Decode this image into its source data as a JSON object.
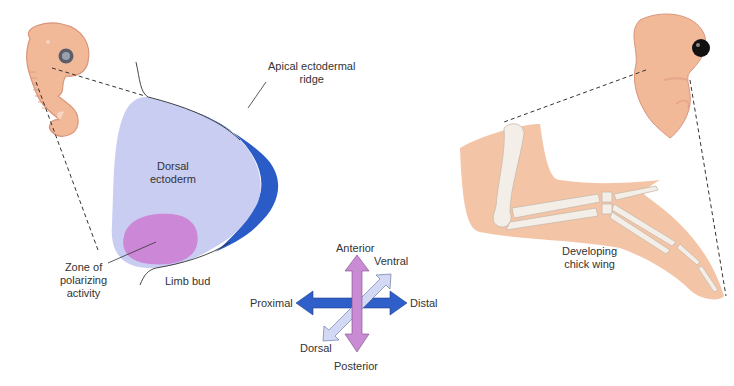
{
  "diagram": {
    "colors": {
      "embryo_skin": "#f2b999",
      "embryo_outline": "#d9957a",
      "dorsal_ectoderm": "#c9cdf2",
      "apical_ridge": "#2a5bc7",
      "zpa": "#cc88d6",
      "arrow_blue": "#2f5fc9",
      "arrow_pink": "#c98bd4",
      "arrow_pale": "#d3d8f5",
      "bone": "#f3efe8",
      "dashed_line": "#333333"
    },
    "labels": {
      "dorsal_ectoderm_line1": "Dorsal",
      "dorsal_ectoderm_line2": "ectoderm",
      "apical_line1": "Apical ectodermal",
      "apical_line2": "ridge",
      "zpa_line1": "Zone of",
      "zpa_line2": "polarizing",
      "zpa_line3": "activity",
      "limb_bud": "Limb bud",
      "anterior": "Anterior",
      "posterior": "Posterior",
      "proximal": "Proximal",
      "distal": "Distal",
      "ventral": "Ventral",
      "dorsal": "Dorsal",
      "wing_line1": "Developing",
      "wing_line2": "chick wing"
    },
    "icons": {
      "embryo_left": "early-embryo-illustration",
      "embryo_right": "chick-embryo-illustration",
      "axes": "four-way-axis-arrows"
    }
  }
}
